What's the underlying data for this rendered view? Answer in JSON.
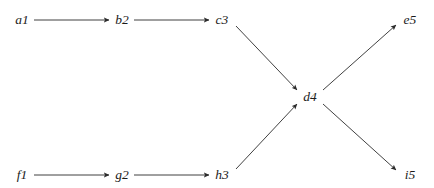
{
  "figure": {
    "type": "directed-graph",
    "background_color": "#ffffff",
    "width": 434,
    "height": 188
  },
  "style": {
    "edge_color": "#2b2b2b",
    "edge_width": 0.9,
    "label_color": "#1b1b1b",
    "label_font_size": 13.5,
    "label_style": "italic",
    "arrowhead": "solid-triangle"
  },
  "graph_data": {
    "type": "diagram",
    "directed": true,
    "nodes": [
      {
        "id": "a1",
        "label": "a1",
        "x": 22,
        "y": 20,
        "layer": 1
      },
      {
        "id": "b2",
        "label": "b2",
        "x": 122,
        "y": 20,
        "layer": 2
      },
      {
        "id": "c3",
        "label": "c3",
        "x": 222,
        "y": 20,
        "layer": 3
      },
      {
        "id": "d4",
        "label": "d4",
        "x": 310,
        "y": 97,
        "layer": 4
      },
      {
        "id": "e5",
        "label": "e5",
        "x": 410,
        "y": 20,
        "layer": 5
      },
      {
        "id": "f1",
        "label": "f1",
        "x": 22,
        "y": 175,
        "layer": 1
      },
      {
        "id": "g2",
        "label": "g2",
        "x": 122,
        "y": 175,
        "layer": 2
      },
      {
        "id": "h3",
        "label": "h3",
        "x": 222,
        "y": 175,
        "layer": 3
      },
      {
        "id": "i5",
        "label": "i5",
        "x": 410,
        "y": 175,
        "layer": 5
      }
    ],
    "edges": [
      {
        "id": "a1-b2",
        "from": "a1",
        "to": "b2",
        "x1": 34,
        "y1": 20,
        "x2": 109,
        "y2": 20
      },
      {
        "id": "b2-c3",
        "from": "b2",
        "to": "c3",
        "x1": 134,
        "y1": 20,
        "x2": 209,
        "y2": 20
      },
      {
        "id": "c3-d4",
        "from": "c3",
        "to": "d4",
        "x1": 236,
        "y1": 26,
        "x2": 297,
        "y2": 90
      },
      {
        "id": "d4-e5",
        "from": "d4",
        "to": "e5",
        "x1": 323,
        "y1": 90,
        "x2": 396,
        "y2": 25
      },
      {
        "id": "f1-g2",
        "from": "f1",
        "to": "g2",
        "x1": 34,
        "y1": 175,
        "x2": 109,
        "y2": 175
      },
      {
        "id": "g2-h3",
        "from": "g2",
        "to": "h3",
        "x1": 134,
        "y1": 175,
        "x2": 209,
        "y2": 175
      },
      {
        "id": "h3-d4",
        "from": "h3",
        "to": "d4",
        "x1": 236,
        "y1": 169,
        "x2": 297,
        "y2": 104
      },
      {
        "id": "d4-i5",
        "from": "d4",
        "to": "i5",
        "x1": 323,
        "y1": 104,
        "x2": 396,
        "y2": 170
      }
    ]
  }
}
